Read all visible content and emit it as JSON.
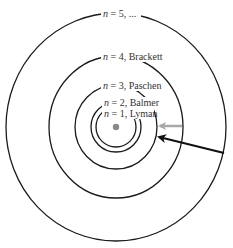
{
  "diagram": {
    "type": "bohr-model-energy-levels",
    "nucleus": {
      "cx": 116,
      "cy": 127,
      "r": 3.2,
      "color": "#8a8a8a"
    },
    "orbits": [
      {
        "n": "1",
        "series": "Lyman",
        "rx": 20,
        "ry": 20,
        "label": {
          "x": 104,
          "y": 117,
          "text_var": "n",
          "text_rest": " = 1, Lyman",
          "bg_w": 52
        }
      },
      {
        "n": "2",
        "series": "Balmer",
        "rx": 25,
        "ry": 25,
        "label": {
          "x": 104,
          "y": 106,
          "text_var": "n",
          "text_rest": " = 2, Balmer",
          "bg_w": 55
        }
      },
      {
        "n": "3",
        "series": "Paschen",
        "rx": 41,
        "ry": 42,
        "label": {
          "x": 103,
          "y": 89,
          "text_var": "n",
          "text_rest": " = 3, Paschen",
          "bg_w": 62
        }
      },
      {
        "n": "4",
        "series": "Brackett",
        "rx": 67,
        "ry": 71,
        "label": {
          "x": 103,
          "y": 60,
          "text_var": "n",
          "text_rest": " = 4, Brackett",
          "bg_w": 64
        }
      },
      {
        "n": "5",
        "series": "...",
        "rx": 110,
        "ry": 114,
        "label": {
          "x": 103,
          "y": 17,
          "text_var": "n",
          "text_rest": " = 5, ...",
          "bg_w": 40
        }
      }
    ],
    "arrows": [
      {
        "name": "gray-transition-arrow",
        "color": "#a8a8a8",
        "x1": 182,
        "y1": 126,
        "x2": 160,
        "y2": 126,
        "stroke_width": 2.5
      },
      {
        "name": "black-transition-arrow",
        "color": "#111111",
        "x1": 224,
        "y1": 153,
        "x2": 159,
        "y2": 137,
        "stroke_width": 2.2
      }
    ]
  }
}
